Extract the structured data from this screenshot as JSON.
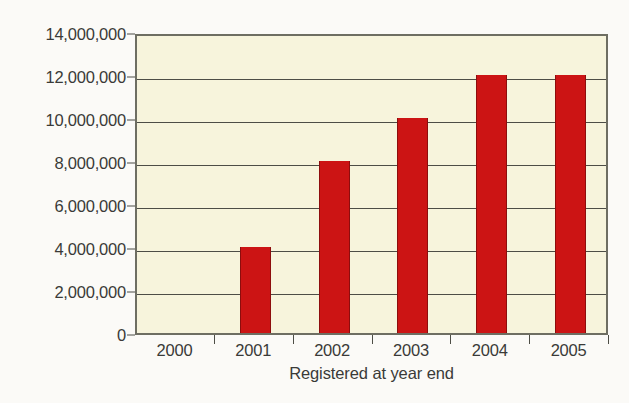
{
  "chart_data": {
    "type": "bar",
    "title": "",
    "subtitle": "",
    "xlabel": "Registered at year end",
    "ylabel": "",
    "categories": [
      "2000",
      "2001",
      "2002",
      "2003",
      "2004",
      "2005"
    ],
    "values": [
      0,
      4000000,
      8000000,
      10000000,
      12000000,
      12000000
    ],
    "series": [
      {
        "name": "Registered",
        "values": [
          0,
          4000000,
          8000000,
          10000000,
          12000000,
          12000000
        ]
      }
    ],
    "ylim": [
      0,
      14000000
    ],
    "ytick_values": [
      0,
      2000000,
      4000000,
      6000000,
      8000000,
      10000000,
      12000000,
      14000000
    ],
    "ytick_labels": [
      "0",
      "2,000,000",
      "4,000,000",
      "6,000,000",
      "8,000,000",
      "10,000,000",
      "12,000,000",
      "14,000,000"
    ],
    "grid": true,
    "legend": false,
    "legend_position": "none",
    "annotations": [],
    "colors": {
      "bar": "#cc1414",
      "bar_edge": "#8d0d0d",
      "plot_background": "#f7f4dc",
      "figure_background": "#fbfaf7",
      "axis": "#4d4d46",
      "frame": "#6e6e62",
      "text": "#3a3a38"
    }
  }
}
